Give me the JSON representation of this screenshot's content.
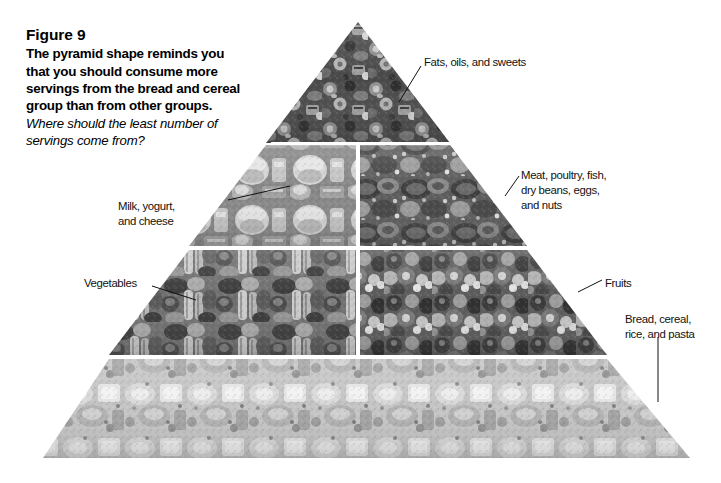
{
  "figure": {
    "title": "Figure 9",
    "body": "The pyramid shape reminds you that you should consume more servings from the bread and cereal group than from other groups.",
    "question": "Where should the least number of servings come from?"
  },
  "diagram": {
    "name": "food-guide-pyramid",
    "background_color": "#ffffff",
    "leader_line_color": "#111111",
    "tiers": [
      {
        "id": "tier-fats",
        "label": "Fats, oils, and sweets",
        "position": "apex",
        "contents": "fats, oils, sweets"
      },
      {
        "id": "tier-milk",
        "label": "Milk, yogurt,\nand cheese",
        "position": "second-left",
        "contents": "milk, yogurt, cheese"
      },
      {
        "id": "tier-meat",
        "label": "Meat, poultry, fish,\ndry beans, eggs,\nand nuts",
        "position": "second-right",
        "contents": "meat, poultry, fish, dry beans, eggs, nuts"
      },
      {
        "id": "tier-vegetables",
        "label": "Vegetables",
        "position": "third-left",
        "contents": "vegetables"
      },
      {
        "id": "tier-fruits",
        "label": "Fruits",
        "position": "third-right",
        "contents": "fruits"
      },
      {
        "id": "tier-bread",
        "label": "Bread, cereal,\nrice, and pasta",
        "position": "base",
        "contents": "bread, cereal, rice, pasta"
      }
    ]
  },
  "labels": {
    "fats": "Fats, oils, and sweets",
    "meat": "Meat, poultry, fish,\ndry beans, eggs,\nand nuts",
    "bread": "Bread, cereal,\nrice, and pasta",
    "milk": "Milk, yogurt,\nand cheese",
    "vegetables": "Vegetables",
    "fruits": "Fruits"
  }
}
